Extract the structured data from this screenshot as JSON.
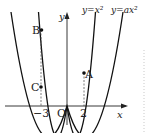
{
  "diagram": {
    "type": "parabola-graph",
    "axes": {
      "x_label": "x",
      "y_label": "y",
      "origin_label": "O"
    },
    "x_ticks": [
      {
        "value": -3,
        "label": "−3"
      },
      {
        "value": 2,
        "label": "2"
      }
    ],
    "curves": [
      {
        "name": "y=x^2",
        "label": "y=x²"
      },
      {
        "name": "y=ax^2",
        "label": "y=ax²"
      }
    ],
    "points": [
      {
        "name": "A",
        "label": "A",
        "on": "y=x^2",
        "x": 2
      },
      {
        "name": "B",
        "label": "B",
        "on": "y=x^2",
        "x": -3
      },
      {
        "name": "C",
        "label": "C",
        "on": "y=ax^2",
        "x": -3
      }
    ]
  }
}
